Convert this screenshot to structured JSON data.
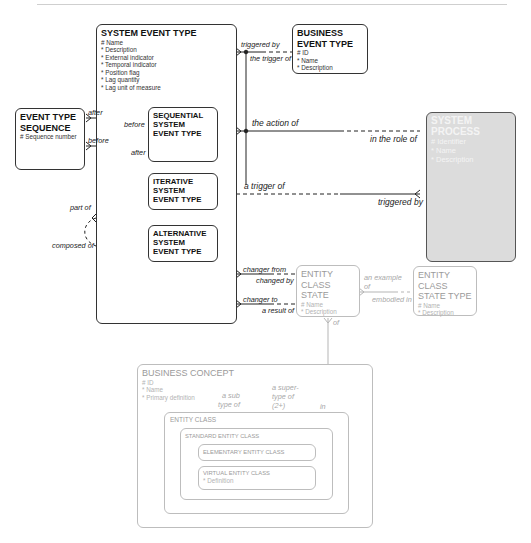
{
  "diagram": {
    "entities": {
      "system_event_type": {
        "title": "SYSTEM EVENT TYPE",
        "attributes": [
          "# Name",
          "* Description",
          "* External indicator",
          "* Temporal indicator",
          "* Position flag",
          "* Lag quantity",
          "* Lag unit of measure"
        ],
        "subtypes": {
          "sequential": "SEQUENTIAL SYSTEM EVENT TYPE",
          "iterative": "ITERATIVE SYSTEM EVENT TYPE",
          "alternative": "ALTERNATIVE SYSTEM EVENT TYPE"
        }
      },
      "business_event_type": {
        "title": "BUSINESS EVENT TYPE",
        "attributes": [
          "# ID",
          "* Name",
          "* Description"
        ]
      },
      "event_type_sequence": {
        "title": "EVENT TYPE SEQUENCE",
        "attributes": [
          "# Sequence number"
        ]
      },
      "system_process": {
        "title": "SYSTEM PROCESS",
        "attributes": [
          "# Identifier",
          "* Name",
          "* Description"
        ]
      },
      "entity_class_state": {
        "title": "ENTITY CLASS STATE",
        "attributes": [
          "# Name",
          "* Description"
        ]
      },
      "entity_class_state_type": {
        "title": "ENTITY CLASS STATE TYPE",
        "attributes": [
          "# Name",
          "* Description"
        ]
      },
      "business_concept": {
        "title": "BUSINESS CONCEPT",
        "attributes": [
          "# ID",
          "* Name",
          "* Primary definition"
        ]
      },
      "entity_class": {
        "title": "ENTITY CLASS"
      },
      "standard_entity_class": {
        "title": "STANDARD ENTITY CLASS"
      },
      "elementary_entity_class": {
        "title": "ELEMENTARY ENTITY CLASS"
      },
      "virtual_entity_class": {
        "title": "VIRTUAL ENTITY CLASS",
        "attributes": [
          "* Definition"
        ]
      }
    },
    "relationships": {
      "triggered_by": "triggered by",
      "the_trigger_of": "the trigger of",
      "after_1": "after",
      "before_1": "before",
      "before_2": "before",
      "after_2": "after",
      "the_action_of": "the action of",
      "in_the_role_of": "in the role of",
      "a_trigger_of": "a trigger of",
      "triggered_by_2": "triggered by",
      "part_of": "part of",
      "composed_of": "composed of",
      "changer_from": "changer from",
      "changed_by": "changed by",
      "changer_to": "changer to",
      "a_result_of": "a result of",
      "an_example_of_1": "an example",
      "an_example_of_2": "of",
      "embodied_in": "embodied in",
      "of": "of",
      "in": "in",
      "a_sub_type_of_1": "a sub",
      "a_sub_type_of_2": "type of",
      "a_super_type_of_1": "a super-",
      "a_super_type_of_2": "type of",
      "a_super_type_of_3": "(2+)"
    }
  }
}
